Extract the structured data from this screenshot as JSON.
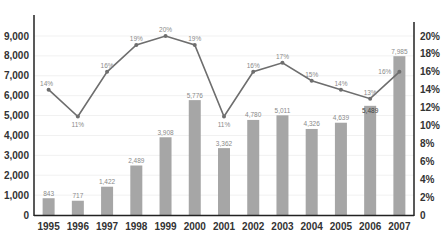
{
  "chart_data": {
    "type": "bar+line",
    "title": "",
    "xlabel": "",
    "ylabel": "",
    "categories": [
      "1995",
      "1996",
      "1997",
      "1998",
      "1999",
      "2000",
      "2001",
      "2002",
      "2003",
      "2004",
      "2005",
      "2006",
      "2007"
    ],
    "series": [
      {
        "name": "Value",
        "type": "bar",
        "axis": "left",
        "values": [
          843,
          717,
          1422,
          2489,
          3908,
          5776,
          3362,
          4780,
          5011,
          4326,
          4639,
          5489,
          7985
        ],
        "labels": [
          "843",
          "717",
          "1,422",
          "2,489",
          "3,908",
          "5,776",
          "3,362",
          "4,780",
          "5,011",
          "4,326",
          "4,639",
          "5,489",
          "7,985"
        ],
        "color": "#a6a6a6"
      },
      {
        "name": "Percent",
        "type": "line",
        "axis": "right",
        "values": [
          14,
          11,
          16,
          19,
          20,
          19,
          11,
          16,
          17,
          15,
          14,
          13,
          16
        ],
        "labels": [
          "14%",
          "11%",
          "16%",
          "19%",
          "20%",
          "19%",
          "11%",
          "16%",
          "17%",
          "15%",
          "14%",
          "13%",
          "16%"
        ],
        "color": "#6e6e6e"
      }
    ],
    "left_axis": {
      "ticks": [
        "0",
        "1,000",
        "2,000",
        "3,000",
        "4,000",
        "5,000",
        "6,000",
        "7,000",
        "8,000",
        "9,000"
      ],
      "tick_values": [
        0,
        1000,
        2000,
        3000,
        4000,
        5000,
        6000,
        7000,
        8000,
        9000
      ],
      "ylim": [
        0,
        9000
      ]
    },
    "right_axis": {
      "ticks": [
        "0",
        "2%",
        "4%",
        "6%",
        "8%",
        "10%",
        "12%",
        "14%",
        "16%",
        "18%",
        "20%"
      ],
      "tick_values": [
        0,
        2,
        4,
        6,
        8,
        10,
        12,
        14,
        16,
        18,
        20
      ],
      "ylim": [
        0,
        20
      ]
    },
    "grid": true,
    "legend": "none"
  }
}
